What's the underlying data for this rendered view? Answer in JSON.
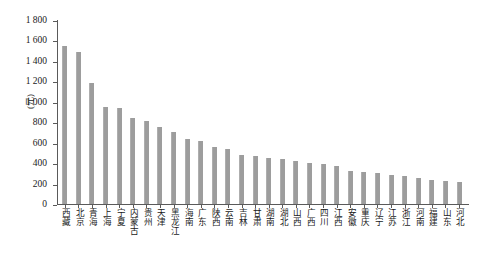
{
  "chart_data": {
    "type": "bar",
    "title": "",
    "xlabel": "",
    "ylabel": "(元)",
    "ylim": [
      0,
      1800
    ],
    "ytick_labels": [
      "1 800",
      "1 600",
      "1 400",
      "1 200",
      "1 000",
      "800",
      "600",
      "400",
      "200",
      "0"
    ],
    "ytick_values": [
      1800,
      1600,
      1400,
      1200,
      1000,
      800,
      600,
      400,
      200,
      0
    ],
    "grid": false,
    "legend": null,
    "bar_color": "#9d9d9d",
    "axis_color": "#5a5a5a",
    "background_color": "#ffffff",
    "categories": [
      "西藏",
      "北京",
      "青海",
      "上海",
      "宁夏",
      "内蒙古",
      "贵州",
      "天津",
      "黑龙江",
      "海南",
      "广东",
      "陕西",
      "云南",
      "吉林",
      "甘肃",
      "湖南",
      "湖北",
      "山西",
      "广西",
      "四川",
      "江西",
      "安徽",
      "重庆",
      "辽宁",
      "江苏",
      "浙江",
      "河南",
      "福建",
      "山东",
      "河北"
    ],
    "values": [
      1550,
      1490,
      1180,
      950,
      940,
      840,
      810,
      750,
      700,
      640,
      620,
      560,
      540,
      480,
      470,
      450,
      440,
      420,
      400,
      390,
      370,
      320,
      310,
      300,
      280,
      270,
      250,
      240,
      230,
      220
    ]
  }
}
